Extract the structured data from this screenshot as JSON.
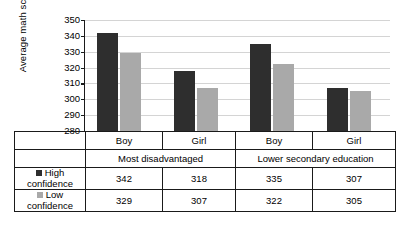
{
  "chart_data": {
    "type": "bar",
    "title": "",
    "xlabel": "",
    "ylabel": "Average math score",
    "ylim": [
      280,
      350
    ],
    "ytick_step": 10,
    "yticks": [
      350,
      340,
      330,
      320,
      310,
      300,
      290,
      280
    ],
    "grid": true,
    "legend_position": "table-row-headers",
    "categories": [
      "Boy",
      "Girl",
      "Boy",
      "Girl"
    ],
    "group_labels": [
      "Most disadvantaged",
      "Lower secondary education"
    ],
    "series": [
      {
        "name": "High confidence",
        "color": "#2e2e2e",
        "values": [
          342,
          318,
          335,
          307
        ]
      },
      {
        "name": "Low confidence",
        "color": "#a9a9a9",
        "values": [
          329,
          307,
          322,
          305
        ]
      }
    ]
  },
  "axis": {
    "y_title": "Average math score",
    "ticks": [
      "350",
      "340",
      "330",
      "320",
      "310",
      "300",
      "290",
      "280"
    ]
  },
  "table": {
    "sex_headers": [
      "Boy",
      "Girl",
      "Boy",
      "Girl"
    ],
    "group_headers": [
      "Most disadvantaged",
      "Lower secondary education"
    ],
    "rows": [
      {
        "label_line1": "High",
        "label_line2": "confidence",
        "swatch_color": "#2e2e2e",
        "values": [
          "342",
          "318",
          "335",
          "307"
        ]
      },
      {
        "label_line1": "Low",
        "label_line2": "confidence",
        "swatch_color": "#a9a9a9",
        "values": [
          "329",
          "307",
          "322",
          "305"
        ]
      }
    ]
  }
}
